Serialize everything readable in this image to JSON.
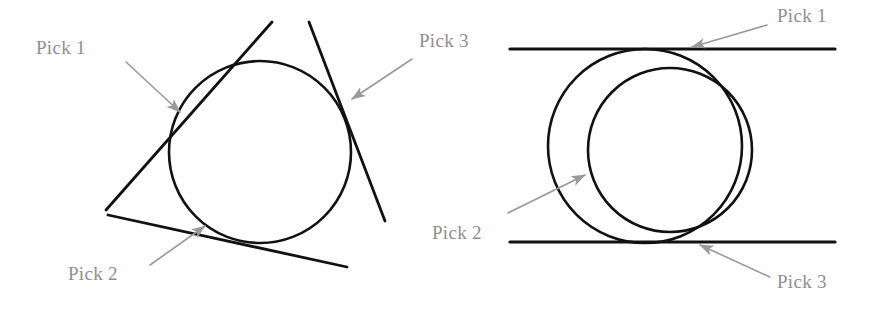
{
  "figure": {
    "background_color": "#fefefe",
    "stroke_color": "#111111",
    "annotation_color": "#9a9a9a",
    "label_text_color": "#8f8f8f"
  },
  "left_diagram": {
    "name": "three-tangent-lines-one-circle",
    "circle": {
      "cx": 260,
      "cy": 152,
      "r": 91,
      "stroke_width": 2.6
    },
    "tangent_lines": [
      {
        "id": "tangent-upper-left",
        "x1": 106,
        "y1": 210,
        "x2": 272,
        "y2": 22,
        "stroke_width": 2.8
      },
      {
        "id": "tangent-upper-right",
        "x1": 309,
        "y1": 22,
        "x2": 385,
        "y2": 221,
        "stroke_width": 2.8
      },
      {
        "id": "tangent-bottom",
        "x1": 108,
        "y1": 215,
        "x2": 347,
        "y2": 267,
        "stroke_width": 2.8
      }
    ],
    "labels": [
      {
        "id": "pick-1",
        "text": "Pick 1",
        "x": 36,
        "y": 38
      },
      {
        "id": "pick-2",
        "text": "Pick 2",
        "x": 68,
        "y": 264
      },
      {
        "id": "pick-3",
        "text": "Pick 3",
        "x": 419,
        "y": 31
      }
    ],
    "arrows": [
      {
        "id": "arrow-pick-1",
        "x1": 126,
        "y1": 62,
        "x2": 180,
        "y2": 112
      },
      {
        "id": "arrow-pick-2",
        "x1": 150,
        "y1": 265,
        "x2": 205,
        "y2": 226
      },
      {
        "id": "arrow-pick-3",
        "x1": 412,
        "y1": 59,
        "x2": 352,
        "y2": 99
      }
    ]
  },
  "right_diagram": {
    "name": "two-parallel-lines-two-circles",
    "outer_circle": {
      "cx": 645,
      "cy": 146,
      "r": 97,
      "stroke_width": 2.6
    },
    "inner_circle": {
      "cx": 670,
      "cy": 150,
      "r": 82,
      "stroke_width": 2.6
    },
    "horizontal_lines": [
      {
        "id": "line-top",
        "x1": 510,
        "y1": 49,
        "x2": 835,
        "y2": 49,
        "stroke_width": 3.2
      },
      {
        "id": "line-bottom",
        "x1": 510,
        "y1": 242,
        "x2": 835,
        "y2": 242,
        "stroke_width": 3.2
      }
    ],
    "labels": [
      {
        "id": "pick-1",
        "text": "Pick 1",
        "x": 777,
        "y": 6
      },
      {
        "id": "pick-2",
        "text": "Pick 2",
        "x": 432,
        "y": 223
      },
      {
        "id": "pick-3",
        "text": "Pick 3",
        "x": 777,
        "y": 272
      }
    ],
    "arrows": [
      {
        "id": "arrow-pick-1",
        "x1": 767,
        "y1": 25,
        "x2": 692,
        "y2": 47
      },
      {
        "id": "arrow-pick-2",
        "x1": 508,
        "y1": 213,
        "x2": 585,
        "y2": 175
      },
      {
        "id": "arrow-pick-3",
        "x1": 770,
        "y1": 277,
        "x2": 700,
        "y2": 245
      }
    ]
  }
}
